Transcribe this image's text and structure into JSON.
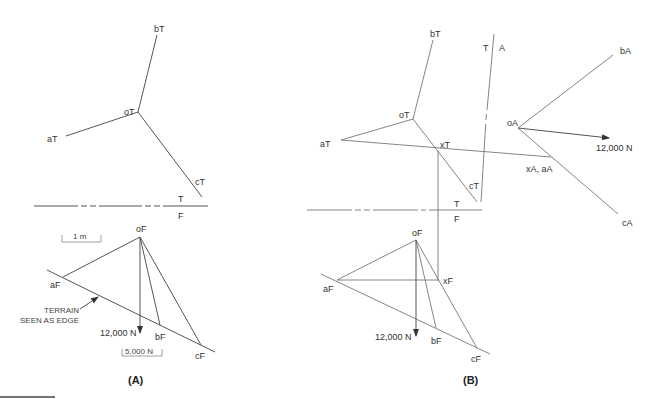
{
  "panel_a": {
    "caption": "(A)",
    "top_view": {
      "labels": {
        "bT": "bT",
        "oT": "oT",
        "aT": "aT",
        "cT": "cT"
      }
    },
    "fold_line": {
      "top": "T",
      "bottom": "F"
    },
    "front_view": {
      "labels": {
        "oF": "oF",
        "aF": "aF",
        "bF": "bF",
        "cF": "cF"
      },
      "length_scale": "1 m",
      "force_scale": "5,000 N",
      "load": "12,000 N",
      "terrain_note_line1": "TERRAIN",
      "terrain_note_line2": "SEEN AS EDGE"
    }
  },
  "panel_b": {
    "caption": "(B)",
    "top_view": {
      "labels": {
        "bT": "bT",
        "oT": "oT",
        "aT": "aT",
        "cT": "cT",
        "xT": "xT"
      }
    },
    "fold_line_tf": {
      "top": "T",
      "bottom": "F"
    },
    "fold_line_ta": {
      "left": "T",
      "right": "A"
    },
    "aux_view": {
      "labels": {
        "bA": "bA",
        "oA": "oA",
        "cA": "cA",
        "xA_aA": "xA, aA"
      },
      "load": "12,000 N"
    },
    "front_view": {
      "labels": {
        "oF": "oF",
        "aF": "aF",
        "bF": "bF",
        "cF": "cF",
        "xF": "xF"
      },
      "load": "12,000 N"
    }
  }
}
